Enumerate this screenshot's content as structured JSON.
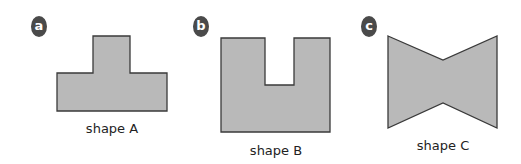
{
  "colors": {
    "fill": "#b9b9b9",
    "stroke": "#3a3a3a",
    "badge": "#4a4a4a"
  },
  "figures": [
    {
      "badge": "a",
      "label": "shape A",
      "shape": "T-shape"
    },
    {
      "badge": "b",
      "label": "shape B",
      "shape": "U-shape"
    },
    {
      "badge": "c",
      "label": "shape C",
      "shape": "bow-tie"
    }
  ]
}
